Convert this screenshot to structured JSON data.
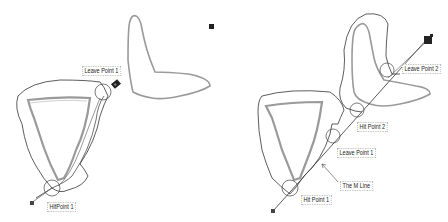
{
  "panels": [
    {
      "id": "left",
      "labels": [
        {
          "text": "Leave Point 1",
          "x": 82,
          "y": 66
        },
        {
          "text": "HitPoint 1",
          "x": 47,
          "y": 202
        }
      ]
    },
    {
      "id": "right",
      "labels": [
        {
          "text": "Leave Point 2",
          "x": 402,
          "y": 64
        },
        {
          "text": "Hit Point 2",
          "x": 357,
          "y": 122
        },
        {
          "text": "Leave Point 1",
          "x": 337,
          "y": 148
        },
        {
          "text": "The M Line",
          "x": 340,
          "y": 181
        },
        {
          "text": "Hit Point 1",
          "x": 301,
          "y": 195
        }
      ]
    }
  ],
  "labels": {
    "left_leave_point_1": "Leave Point 1",
    "left_hit_point_1": "HitPoint 1",
    "right_leave_point_2": "Leave Point 2",
    "right_hit_point_2": "Hit Point 2",
    "right_leave_point_1": "Leave Point 1",
    "right_m_line": "The M Line",
    "right_hit_point_1": "Hit Point 1"
  },
  "colors": {
    "obstacle": "#9a9a9a",
    "path": "#333333",
    "robot": "#222222"
  }
}
